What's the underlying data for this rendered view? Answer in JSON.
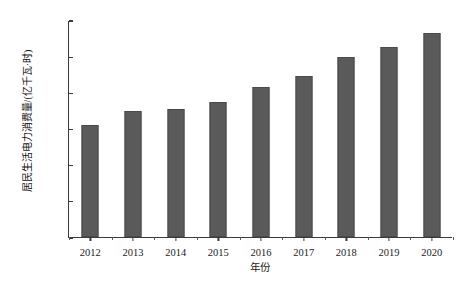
{
  "chart_data": {
    "type": "bar",
    "title": "",
    "subtitle": "",
    "xlabel": "年份",
    "ylabel": "居民生活电力消费量/(亿千瓦·时)",
    "categories": [
      "2012",
      "2013",
      "2014",
      "2015",
      "2016",
      "2017",
      "2018",
      "2019",
      "2020"
    ],
    "values": [
      6200,
      6950,
      7100,
      7450,
      8300,
      8900,
      9950,
      10500,
      11300
    ],
    "series": [
      {
        "name": "居民生活电力消费量",
        "values": [
          6200,
          6950,
          7100,
          7450,
          8300,
          8900,
          9950,
          10500,
          11300
        ]
      }
    ],
    "ylim": [
      0,
      12000
    ],
    "yticks": [
      0,
      2000,
      4000,
      6000,
      8000,
      10000,
      12000
    ],
    "ytick_labels": [
      "0",
      "2 000",
      "4 000",
      "6 000",
      "8 000",
      "10 000",
      "12 000"
    ],
    "xtick_labels": [
      "2012",
      "2013",
      "2014",
      "2015",
      "2016",
      "2017",
      "2018",
      "2019",
      "2020"
    ],
    "grid": false,
    "legend": false,
    "legend_position": "none",
    "bar_color": "#5a5a5a",
    "axis_color": "#3a3a3a",
    "background_color": "#ffffff"
  }
}
